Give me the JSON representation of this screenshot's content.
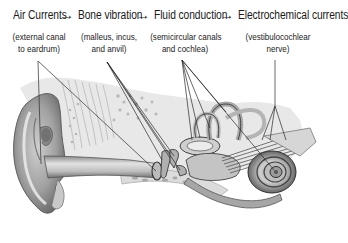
{
  "diagram": {
    "stages": [
      {
        "label": "Air Currents",
        "detail_line1": "(external canal",
        "detail_line2": "to eardrum)"
      },
      {
        "label": "Bone vibration",
        "detail_line1": "(malleus, incus,",
        "detail_line2": "and anvil)"
      },
      {
        "label": "Fluid conduction",
        "detail_line1": "(semicircular canals",
        "detail_line2": "and cochlea)"
      },
      {
        "label": "Electrochemical currents",
        "detail_line1": "(vestibulocochlear",
        "detail_line2": "nerve)"
      }
    ],
    "arrow_glyph": "→",
    "illustration": "cross-section of human ear: outer ear (pinna), external auditory canal, eardrum, ossicles, semicircular canals, cochlea, vestibulocochlear nerve",
    "colors": {
      "text": "#1a1a1a",
      "leader_lines": "#2a2a2a",
      "illustration_dark": "#555555",
      "illustration_mid": "#9a9a9a",
      "illustration_light": "#d8d8d8",
      "background": "#ffffff"
    }
  }
}
